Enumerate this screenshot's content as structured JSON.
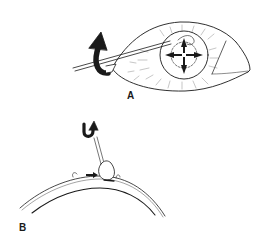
{
  "figure": {
    "type": "surgical line illustration",
    "background": "#ffffff",
    "ink_color": "#1a1a1a",
    "panels": [
      {
        "id": "A",
        "label": "A",
        "depicts": "eye with cotton swab at limbus; thick curved arrow indicating rotation; four radiating arrows on cornea",
        "icons": [
          "eye-illustration",
          "swab-icon",
          "rotate-arrow-icon",
          "four-way-arrows-icon"
        ]
      },
      {
        "id": "B",
        "label": "B",
        "depicts": "cross-section of globe surface with swab rolling tissue; U-turn arrow and small pointer arrow",
        "icons": [
          "globe-cross-section",
          "swab-icon",
          "u-turn-arrow-icon",
          "pointer-arrow-icon"
        ]
      }
    ]
  }
}
